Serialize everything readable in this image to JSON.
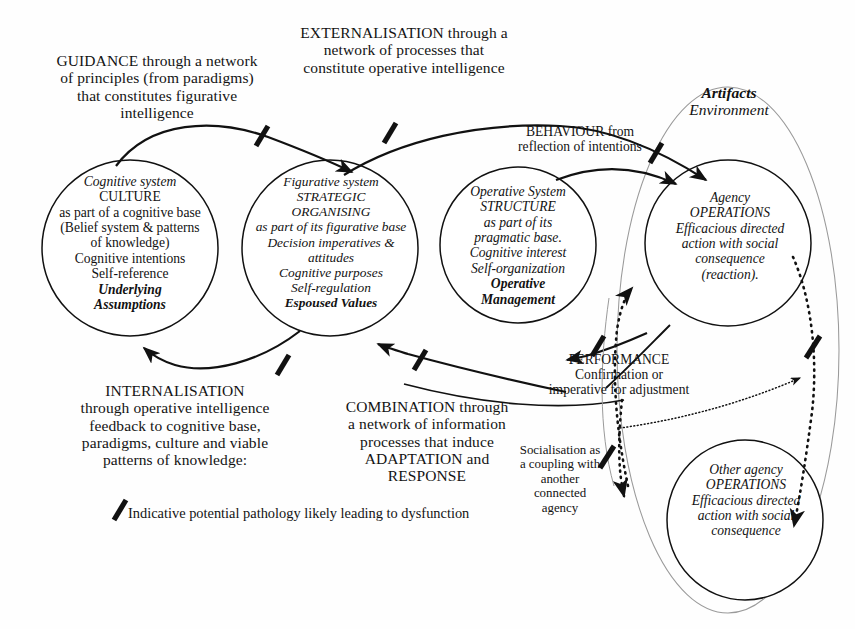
{
  "diagram": {
    "type": "concept-diagram"
  },
  "nodes": [
    {
      "id": "cognitive",
      "name": "cognitive-system-circle",
      "lines": [
        {
          "text": "Cognitive system",
          "style": "it"
        },
        {
          "text": "CULTURE",
          "style": ""
        },
        {
          "text": "as part of a cognitive base",
          "style": ""
        },
        {
          "text": "(Belief system & patterns",
          "style": ""
        },
        {
          "text": "of knowledge)",
          "style": ""
        },
        {
          "text": "Cognitive intentions",
          "style": ""
        },
        {
          "text": "Self-reference",
          "style": ""
        },
        {
          "text": "Underlying",
          "style": "bdit"
        },
        {
          "text": "Assumptions",
          "style": "bdit"
        }
      ]
    },
    {
      "id": "figurative",
      "name": "figurative-system-circle",
      "lines": [
        {
          "text": "Figurative system",
          "style": "it"
        },
        {
          "text": "STRATEGIC",
          "style": "it"
        },
        {
          "text": "ORGANISING",
          "style": "it"
        },
        {
          "text": "as part of its figurative base",
          "style": "it"
        },
        {
          "text": "Decision imperatives &",
          "style": "it"
        },
        {
          "text": "attitudes",
          "style": "it"
        },
        {
          "text": "Cognitive purposes",
          "style": "it"
        },
        {
          "text": "Self-regulation",
          "style": "it"
        },
        {
          "text": "Espoused Values",
          "style": "bdit"
        }
      ]
    },
    {
      "id": "operative",
      "name": "operative-system-circle",
      "lines": [
        {
          "text": "Operative System",
          "style": "it"
        },
        {
          "text": "STRUCTURE",
          "style": "it"
        },
        {
          "text": "as part of its",
          "style": "it"
        },
        {
          "text": "pragmatic base.",
          "style": "it"
        },
        {
          "text": "Cognitive interest",
          "style": "it"
        },
        {
          "text": "Self-organization",
          "style": "it"
        },
        {
          "text": "Operative",
          "style": "bdit"
        },
        {
          "text": "Management",
          "style": "bdit"
        }
      ]
    },
    {
      "id": "agency",
      "name": "agency-operations-circle",
      "lines": [
        {
          "text": "Agency",
          "style": "it"
        },
        {
          "text": "OPERATIONS",
          "style": "it"
        },
        {
          "text": "Efficacious directed",
          "style": "it"
        },
        {
          "text": "action with social",
          "style": "it"
        },
        {
          "text": "consequence",
          "style": "it"
        },
        {
          "text": "(reaction).",
          "style": "it"
        }
      ]
    },
    {
      "id": "other_agency",
      "name": "other-agency-operations-circle",
      "lines": [
        {
          "text": "Other agency",
          "style": "it"
        },
        {
          "text": "OPERATIONS",
          "style": "it"
        },
        {
          "text": "Efficacious directed",
          "style": "it"
        },
        {
          "text": "action with social",
          "style": "it"
        },
        {
          "text": "consequence",
          "style": "it"
        }
      ]
    }
  ],
  "labels": {
    "guidance": "GUIDANCE through a network\nof principles (from paradigms)\nthat constitutes figurative\nintelligence",
    "externalisation": "EXTERNALISATION through a\nnetwork of processes that\nconstitute operative intelligence",
    "behaviour": "BEHAVIOUR from\nreflection of intentions",
    "performance": "PERFORMANCE\nConfirmation or\nimperative for adjustment",
    "internalisation": "INTERNALISATION\nthrough operative intelligence\nfeedback to cognitive base,\nparadigms, culture and viable\npatterns of knowledge:",
    "combination": "COMBINATION through\na network of information\nprocesses that induce\nADAPTATION and\nRESPONSE",
    "socialisation": "Socialisation as\na coupling with\nanother\nconnected\nagency",
    "legend": "Indicative potential pathology likely leading to dysfunction"
  },
  "environment": {
    "name": "artifacts-environment-boundary",
    "line1": "Artifacts",
    "line2": "Environment"
  },
  "colors": {
    "stroke": "#111111",
    "faint_stroke": "#8a8a8a",
    "background": "#fefefe",
    "text": "#121212"
  }
}
